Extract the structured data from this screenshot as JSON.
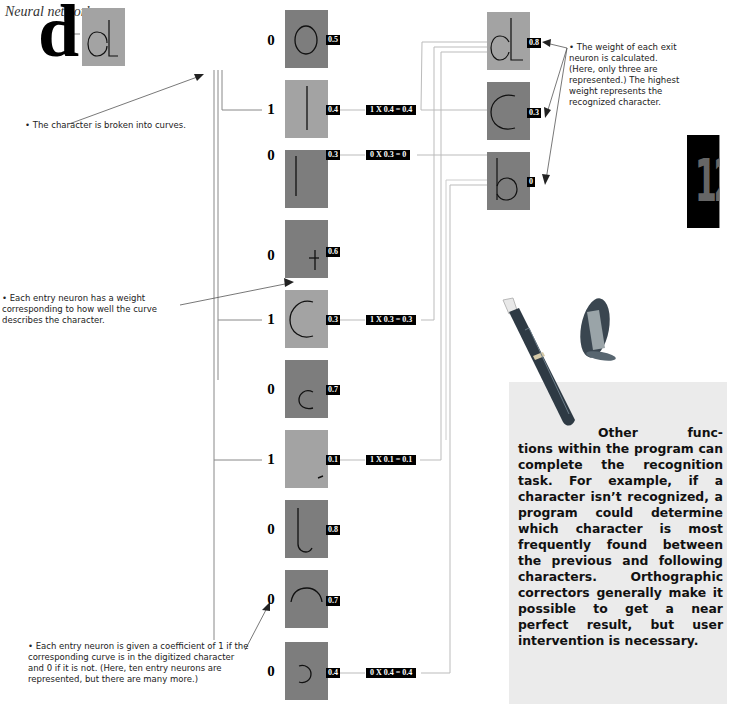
{
  "title": "Neural network",
  "input_character": "d",
  "digitized_box": {
    "glyph": "d",
    "shade": "light"
  },
  "entry_neurons": [
    {
      "curve": "oval",
      "coefficient": "0",
      "weight": "0.5",
      "shade": "dark",
      "calc": null
    },
    {
      "curve": "vertical-line-tall",
      "coefficient": "1",
      "weight": "0.4",
      "shade": "light",
      "calc": "1 X 0.4 = 0.4"
    },
    {
      "curve": "vertical-line",
      "coefficient": "0",
      "weight": "0.3",
      "shade": "dark",
      "calc": "0 X 0.3 = 0"
    },
    {
      "curve": "cross",
      "coefficient": "0",
      "weight": "0.6",
      "shade": "dark",
      "calc": null
    },
    {
      "curve": "c-arc-large",
      "coefficient": "1",
      "weight": "0.3",
      "shade": "light",
      "calc": "1 X 0.3 = 0.3"
    },
    {
      "curve": "c-arc-small",
      "coefficient": "0",
      "weight": "0.7",
      "shade": "dark",
      "calc": null
    },
    {
      "curve": "small-tick",
      "coefficient": "1",
      "weight": "0.1",
      "shade": "light",
      "calc": "1 X 0.1 = 0.1"
    },
    {
      "curve": "j-hook",
      "coefficient": "0",
      "weight": "0.8",
      "shade": "dark",
      "calc": null
    },
    {
      "curve": "top-arch",
      "coefficient": "0",
      "weight": "0.7",
      "shade": "dark",
      "calc": null
    },
    {
      "curve": "reverse-c",
      "coefficient": "0",
      "weight": "0.4",
      "shade": "dark",
      "calc": "0 X 0.4 = 0.4"
    }
  ],
  "exit_neurons": [
    {
      "glyph": "d",
      "weight": "0.8",
      "shade": "light"
    },
    {
      "glyph": "c",
      "weight": "0.3",
      "shade": "dark"
    },
    {
      "glyph": "b",
      "weight": "0",
      "shade": "dark"
    }
  ],
  "notes": {
    "broken_into_curves": "• The character is broken into curves.",
    "entry_weight": "• Each entry neuron has a weight corresponding to how well the curve describes the character.",
    "entry_coefficient": "• Each entry neuron is given a coefficient of 1 if the corresponding curve is in the digitized character and 0 if it is not. (Here, ten entry neurons are represented, but there are many more.)",
    "exit_weight": "• The weight of each exit neuron is calculated. (Here, only three are represented.) The highest weight represents the recognized character."
  },
  "chapter_tab": "12",
  "sidebar": {
    "first_line": "Other func-",
    "body": "tions within the program can complete the recognition task. For example, if a character isn’t recognized, a program could determine which character is most frequently found between the previous and following characters. Orthographic correctors generally make it possible to get a near perfect result, but user intervention is necessary."
  },
  "colors": {
    "light_box": "#a3a3a3",
    "dark_box": "#7d7d7d",
    "label_bg": "#000000",
    "panel_bg": "#ebebeb",
    "line": "#bdbdbd"
  }
}
